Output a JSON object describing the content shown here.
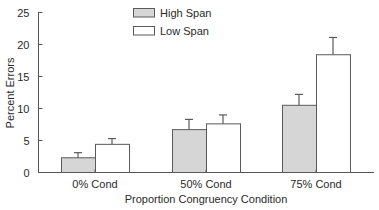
{
  "chart_data": {
    "type": "bar",
    "title": "",
    "xlabel": "Proportion Congruency Condition",
    "ylabel": "Percent Errors",
    "ylim": [
      0,
      25
    ],
    "yticks": [
      0,
      5,
      10,
      15,
      20,
      25
    ],
    "grid": false,
    "legend_position": "top-center",
    "categories": [
      "0% Cond",
      "50% Cond",
      "75% Cond"
    ],
    "series": [
      {
        "name": "High Span",
        "color": "#d6d6d6",
        "values": [
          2.3,
          6.7,
          10.5
        ],
        "error": [
          0.8,
          1.6,
          1.7
        ]
      },
      {
        "name": "Low Span",
        "color": "#ffffff",
        "values": [
          4.4,
          7.6,
          18.4
        ],
        "error": [
          0.9,
          1.4,
          2.7
        ]
      }
    ]
  }
}
